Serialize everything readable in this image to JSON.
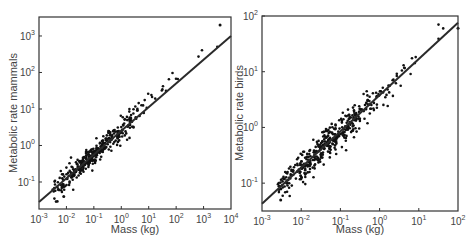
{
  "chart_data": [
    {
      "type": "scatter",
      "title": "",
      "xlabel": "Mass (kg)",
      "ylabel": "Metabolic rate mammals",
      "xscale": "log",
      "yscale": "log",
      "xlim_log10": [
        -3,
        4
      ],
      "ylim_log10": [
        -1.74,
        3.52
      ],
      "x_ticks": [
        "10^-3",
        "10^-2",
        "10^-1",
        "10^0",
        "10^1",
        "10^2",
        "10^3",
        "10^4"
      ],
      "y_ticks": [
        "10^-1",
        "10^0",
        "10^1",
        "10^2",
        "10^3"
      ],
      "grid": false,
      "legend": null,
      "fit_line": {
        "slope_log": 0.65,
        "intercept_log10_at_x0": 0.4,
        "x_range_log10": [
          -3,
          4
        ]
      },
      "series": [
        {
          "name": "mammals",
          "log10_x_range": [
            -2.5,
            3.6
          ],
          "log10_y_approx": "0.4 + 0.65*log10(mass) with scatter ±0.3",
          "n_points": 380,
          "notable_points": [
            {
              "mass_kg": 4000,
              "rate": 2000
            },
            {
              "mass_kg": 0.008,
              "rate": 0.04
            }
          ]
        }
      ]
    },
    {
      "type": "scatter",
      "title": "",
      "xlabel": "Mass (kg)",
      "ylabel": "Metabolic rate birds",
      "xscale": "log",
      "yscale": "log",
      "xlim_log10": [
        -3,
        2
      ],
      "ylim_log10": [
        -1.5,
        2
      ],
      "x_ticks": [
        "10^-3",
        "10^-2",
        "10^-1",
        "10^0",
        "10^1",
        "10^2"
      ],
      "y_ticks": [
        "10^-1",
        "10^0",
        "10^1",
        "10^2"
      ],
      "grid": false,
      "legend": null,
      "fit_line": {
        "slope_log": 0.65,
        "intercept_log10_at_x0": 0.58,
        "x_range_log10": [
          -3,
          2
        ]
      },
      "series": [
        {
          "name": "birds",
          "log10_x_range": [
            -2.6,
            2.0
          ],
          "log10_y_approx": "0.58 + 0.65*log10(mass) with scatter ±0.25",
          "n_points": 420,
          "notable_points": [
            {
              "mass_kg": 100,
              "rate": 60
            },
            {
              "mass_kg": 0.003,
              "rate": 0.05
            }
          ]
        }
      ]
    }
  ],
  "panels": [
    {
      "xlabel": "Mass (kg)",
      "ylabel": "Metabolic rate mammals",
      "xticks": [
        {
          "base": "10",
          "exp": "-3"
        },
        {
          "base": "10",
          "exp": "-2"
        },
        {
          "base": "10",
          "exp": "-1"
        },
        {
          "base": "10",
          "exp": "0"
        },
        {
          "base": "10",
          "exp": "1"
        },
        {
          "base": "10",
          "exp": "2"
        },
        {
          "base": "10",
          "exp": "3"
        },
        {
          "base": "10",
          "exp": "4"
        }
      ],
      "yticks": [
        {
          "base": "10",
          "exp": "-1"
        },
        {
          "base": "10",
          "exp": "0"
        },
        {
          "base": "10",
          "exp": "1"
        },
        {
          "base": "10",
          "exp": "2"
        },
        {
          "base": "10",
          "exp": "3"
        }
      ]
    },
    {
      "xlabel": "Mass (kg)",
      "ylabel": "Metabolic rate birds",
      "xticks": [
        {
          "base": "10",
          "exp": "-3"
        },
        {
          "base": "10",
          "exp": "-2"
        },
        {
          "base": "10",
          "exp": "-1"
        },
        {
          "base": "10",
          "exp": "0"
        },
        {
          "base": "10",
          "exp": "1"
        },
        {
          "base": "10",
          "exp": "2"
        }
      ],
      "yticks": [
        {
          "base": "10",
          "exp": "-1"
        },
        {
          "base": "10",
          "exp": "0"
        },
        {
          "base": "10",
          "exp": "1"
        },
        {
          "base": "10",
          "exp": "2"
        }
      ]
    }
  ],
  "colors": {
    "axis": "#333333",
    "points": "#111111",
    "line": "#2a2a2a",
    "text": "#444444"
  }
}
